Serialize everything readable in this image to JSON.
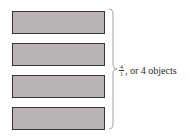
{
  "diagram": {
    "bars": [
      {
        "id": 1,
        "fill": "#b9b3b8"
      },
      {
        "id": 2,
        "fill": "#b9b3b8"
      },
      {
        "id": 3,
        "fill": "#b9b3b8"
      },
      {
        "id": 4,
        "fill": "#b9b3b8"
      }
    ],
    "label": {
      "numerator": "4",
      "denominator": "1",
      "suffix": ", or 4 objects"
    }
  }
}
